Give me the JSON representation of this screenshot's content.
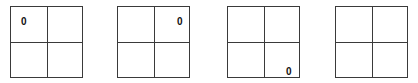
{
  "diagram": {
    "line_color": "#3a3a3a",
    "grids": [
      {
        "index": 0,
        "cells": [
          {
            "row": 0,
            "col": 0,
            "value": "0"
          },
          {
            "row": 0,
            "col": 1,
            "value": ""
          },
          {
            "row": 1,
            "col": 0,
            "value": ""
          },
          {
            "row": 1,
            "col": 1,
            "value": ""
          }
        ]
      },
      {
        "index": 1,
        "cells": [
          {
            "row": 0,
            "col": 0,
            "value": ""
          },
          {
            "row": 0,
            "col": 1,
            "value": "0"
          },
          {
            "row": 1,
            "col": 0,
            "value": ""
          },
          {
            "row": 1,
            "col": 1,
            "value": ""
          }
        ]
      },
      {
        "index": 2,
        "cells": [
          {
            "row": 0,
            "col": 0,
            "value": ""
          },
          {
            "row": 0,
            "col": 1,
            "value": ""
          },
          {
            "row": 1,
            "col": 0,
            "value": ""
          },
          {
            "row": 1,
            "col": 1,
            "value": "0"
          }
        ]
      },
      {
        "index": 3,
        "cells": [
          {
            "row": 0,
            "col": 0,
            "value": ""
          },
          {
            "row": 0,
            "col": 1,
            "value": ""
          },
          {
            "row": 1,
            "col": 0,
            "value": ""
          },
          {
            "row": 1,
            "col": 1,
            "value": ""
          }
        ]
      }
    ]
  }
}
